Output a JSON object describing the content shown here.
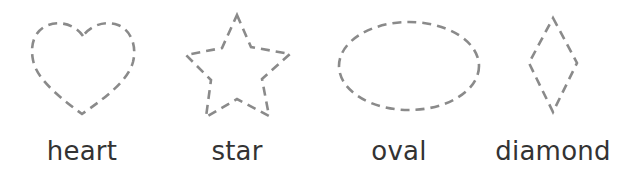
{
  "shapes": [
    {
      "id": "heart",
      "label": "heart",
      "icon": "heart-outline-dashed"
    },
    {
      "id": "star",
      "label": "star",
      "icon": "star-outline-dashed"
    },
    {
      "id": "oval",
      "label": "oval",
      "icon": "oval-outline-dashed"
    },
    {
      "id": "diamond",
      "label": "diamond",
      "icon": "diamond-outline-dashed"
    }
  ],
  "colors": {
    "stroke": "#8a8a8a",
    "text": "#333333",
    "background": "#ffffff"
  }
}
